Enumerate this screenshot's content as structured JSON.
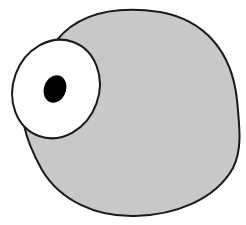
{
  "illustration": {
    "subject": "one-eyed gray blob creature",
    "colors": {
      "background": "#ffffff",
      "body_fill": "#c8c8c8",
      "outline": "#1a1a1a",
      "eye_white": "#ffffff",
      "pupil": "#000000"
    }
  }
}
